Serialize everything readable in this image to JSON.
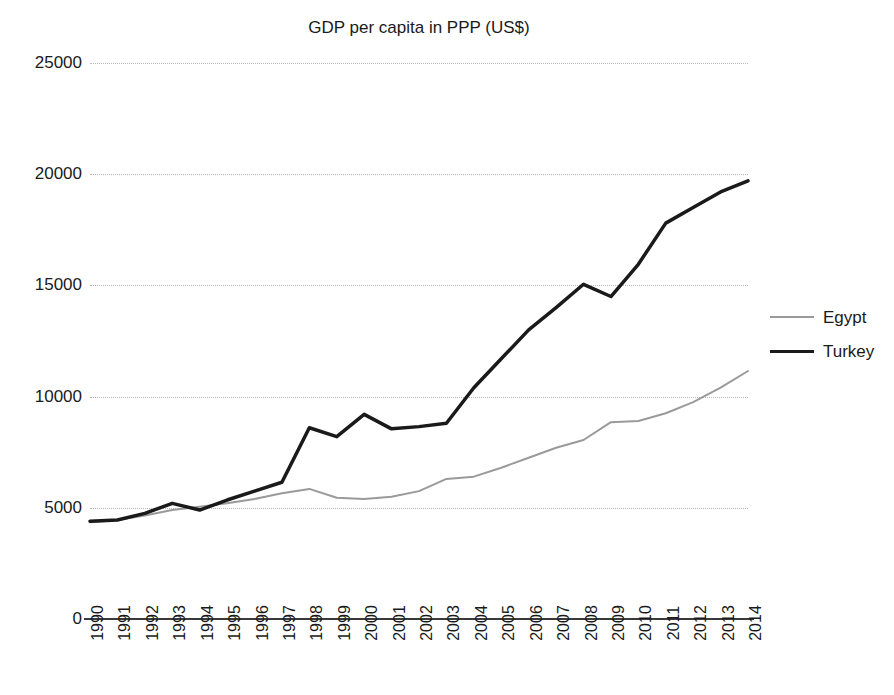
{
  "chart_data": {
    "type": "line",
    "title": "GDP per capita in PPP (US$)",
    "xlabel": "",
    "ylabel": "",
    "ylim": [
      0,
      25000
    ],
    "yticks": [
      0,
      5000,
      10000,
      15000,
      20000,
      25000
    ],
    "ytick_labels": [
      "0",
      "5000",
      "10000",
      "15000",
      "20000",
      "25000"
    ],
    "grid": true,
    "grid_axis": "y",
    "legend_position": "right",
    "x": [
      1990,
      1991,
      1992,
      1993,
      1994,
      1995,
      1996,
      1997,
      1998,
      1999,
      2000,
      2001,
      2002,
      2003,
      2004,
      2005,
      2006,
      2007,
      2008,
      2009,
      2010,
      2011,
      2012,
      2013,
      2014
    ],
    "categories": [
      "1990",
      "1991",
      "1992",
      "1993",
      "1994",
      "1995",
      "1996",
      "1997",
      "1998",
      "1999",
      "2000",
      "2001",
      "2002",
      "2003",
      "2004",
      "2005",
      "2006",
      "2007",
      "2008",
      "2009",
      "2010",
      "2011",
      "2012",
      "2013",
      "2014"
    ],
    "series": [
      {
        "name": "Egypt",
        "color": "#9a9a9a",
        "line_width": 2,
        "values": [
          4350,
          4450,
          4650,
          4900,
          5050,
          5200,
          5400,
          5650,
          5850,
          5450,
          5400,
          5500,
          5750,
          6300,
          6400,
          6800,
          7250,
          7700,
          8050,
          8850,
          8900,
          9250,
          9750,
          10400,
          11150
        ]
      },
      {
        "name": "Turkey",
        "color": "#1a1a1a",
        "line_width": 3.5,
        "values": [
          4400,
          4450,
          4750,
          5200,
          4900,
          5350,
          5750,
          6150,
          8600,
          8200,
          9200,
          8550,
          8650,
          8800,
          10400,
          11700,
          13000,
          14000,
          15050,
          14500,
          15950,
          17800,
          18500,
          19200,
          19700
        ]
      }
    ]
  },
  "legend": {
    "entries": [
      {
        "label": "Egypt",
        "color": "#9a9a9a",
        "width": 2
      },
      {
        "label": "Turkey",
        "color": "#1a1a1a",
        "width": 3.5
      }
    ]
  }
}
